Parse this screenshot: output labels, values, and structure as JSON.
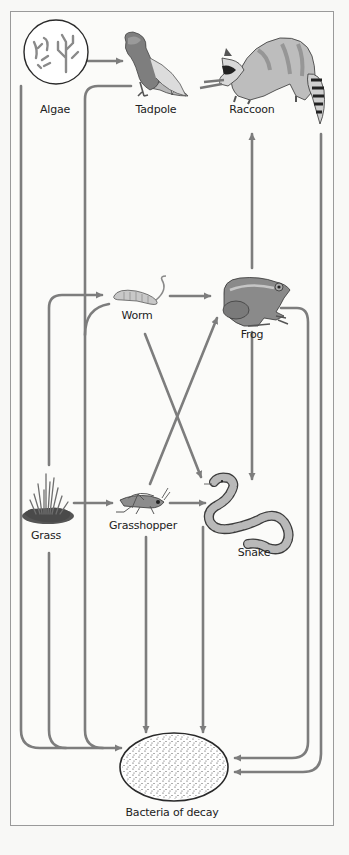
{
  "diagram": {
    "type": "food-web",
    "colors": {
      "arrow": "#7d7d7d",
      "frame_border": "#9a9a9a",
      "background": "#fbfbf9",
      "label_text": "#222222"
    },
    "organisms": [
      {
        "id": "algae",
        "label": "Algae",
        "icon": "algae-icon"
      },
      {
        "id": "tadpole",
        "label": "Tadpole",
        "icon": "tadpole-icon"
      },
      {
        "id": "raccoon",
        "label": "Raccoon",
        "icon": "raccoon-icon"
      },
      {
        "id": "worm",
        "label": "Worm",
        "icon": "worm-icon"
      },
      {
        "id": "frog",
        "label": "Frog",
        "icon": "frog-icon"
      },
      {
        "id": "grass",
        "label": "Grass",
        "icon": "grass-icon"
      },
      {
        "id": "grasshopper",
        "label": "Grasshopper",
        "icon": "grasshopper-icon"
      },
      {
        "id": "snake",
        "label": "Snake",
        "icon": "snake-icon"
      },
      {
        "id": "bacteria",
        "label": "Bacteria of decay",
        "icon": "bacteria-icon"
      }
    ],
    "edges": [
      {
        "from": "algae",
        "to": "tadpole"
      },
      {
        "from": "frog",
        "to": "raccoon"
      },
      {
        "from": "grass",
        "to": "worm"
      },
      {
        "from": "grass",
        "to": "grasshopper"
      },
      {
        "from": "worm",
        "to": "frog"
      },
      {
        "from": "worm",
        "to": "snake"
      },
      {
        "from": "grasshopper",
        "to": "frog"
      },
      {
        "from": "grasshopper",
        "to": "snake"
      },
      {
        "from": "frog",
        "to": "snake"
      },
      {
        "from": "algae",
        "to": "bacteria"
      },
      {
        "from": "tadpole",
        "to": "bacteria"
      },
      {
        "from": "worm",
        "to": "bacteria"
      },
      {
        "from": "grass",
        "to": "bacteria"
      },
      {
        "from": "grasshopper",
        "to": "bacteria"
      },
      {
        "from": "snake",
        "to": "bacteria"
      },
      {
        "from": "frog",
        "to": "bacteria"
      },
      {
        "from": "raccoon",
        "to": "bacteria"
      }
    ]
  },
  "labels": {
    "algae": "Algae",
    "tadpole": "Tadpole",
    "raccoon": "Raccoon",
    "worm": "Worm",
    "frog": "Frog",
    "grass": "Grass",
    "grasshopper": "Grasshopper",
    "snake": "Snake",
    "bacteria": "Bacteria of decay"
  }
}
